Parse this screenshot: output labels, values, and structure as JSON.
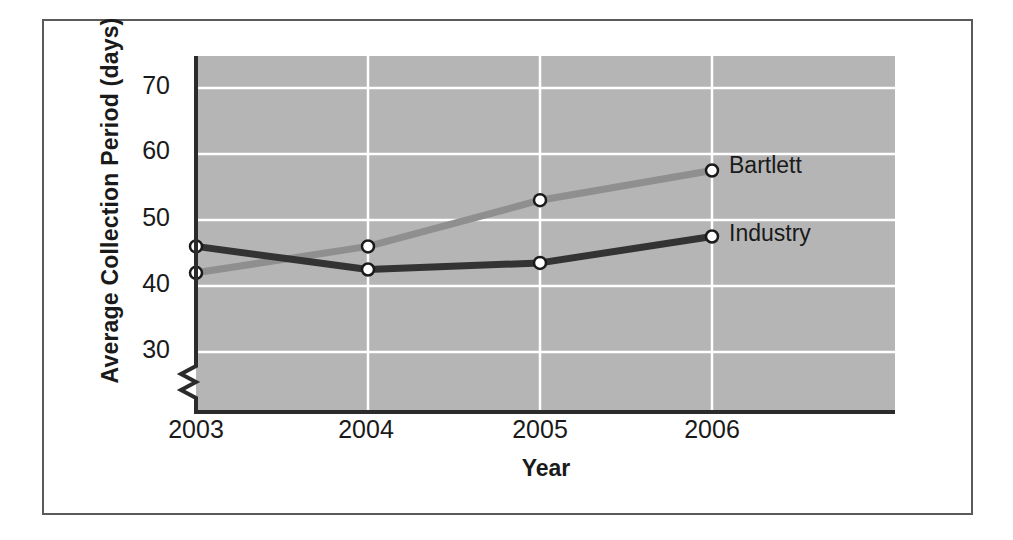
{
  "chart_data": {
    "type": "line",
    "title": "",
    "xlabel": "Year",
    "ylabel": "Average Collection Period (days)",
    "categories": [
      "2003",
      "2004",
      "2005",
      "2006"
    ],
    "x": [
      2003,
      2004,
      2005,
      2006
    ],
    "series": [
      {
        "name": "Bartlett",
        "values": [
          42,
          46,
          53,
          57.5
        ],
        "color": "#8f8f8f"
      },
      {
        "name": "Industry",
        "values": [
          46,
          42.5,
          43.5,
          47.5
        ],
        "color": "#333333"
      }
    ],
    "yticks": [
      30,
      40,
      50,
      60,
      70
    ],
    "ylim": [
      25,
      75
    ],
    "xlim": [
      2003,
      2006
    ],
    "grid": true,
    "grid_color": "#ffffff",
    "plot_background": "#b5b5b5",
    "axis_break": true,
    "legend_position": "inline-right-of-last-point",
    "marker": "open-circle"
  },
  "axes": {
    "y_title": "Average Collection Period (days)",
    "x_title": "Year",
    "y_tick_labels": [
      "70",
      "60",
      "50",
      "40",
      "30"
    ],
    "x_tick_labels": [
      "2003",
      "2004",
      "2005",
      "2006"
    ]
  },
  "annotations": {
    "bartlett_label": "Bartlett",
    "industry_label": "Industry"
  },
  "colors": {
    "bartlett_line": "#8f8f8f",
    "industry_line": "#333333",
    "plot_area": "#b5b5b5",
    "gridline": "#ffffff",
    "axis": "#2b2b2b",
    "frame_border": "#5a5a5a",
    "text": "#1a1a1a"
  }
}
